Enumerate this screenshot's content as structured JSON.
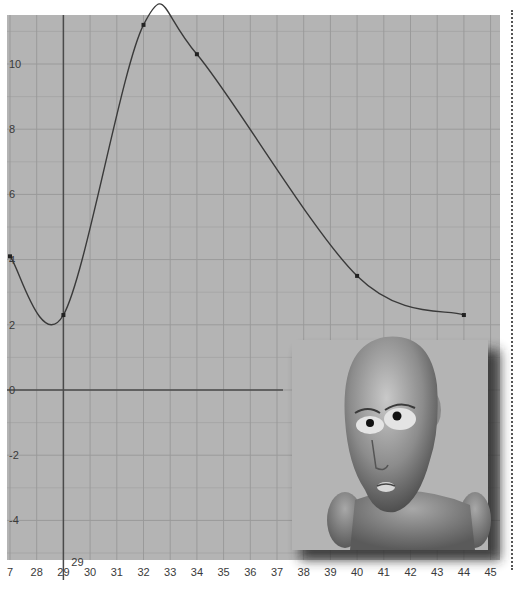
{
  "chart_data": {
    "type": "line",
    "title": "",
    "xlabel": "",
    "ylabel": "",
    "x_ticks": [
      27,
      28,
      29,
      30,
      31,
      32,
      33,
      34,
      35,
      36,
      37,
      38,
      39,
      40,
      41,
      42,
      43,
      44,
      45
    ],
    "x_tick_labels": [
      "7",
      "28",
      "29",
      "30",
      "31",
      "32",
      "33",
      "34",
      "35",
      "36",
      "37",
      "38",
      "39",
      "40",
      "41",
      "42",
      "43",
      "44",
      "45"
    ],
    "current_frame_label": "29",
    "y_ticks": [
      10,
      8,
      6,
      4,
      2,
      0,
      -2,
      -4
    ],
    "y_tick_labels": [
      "10",
      "8",
      "6",
      "4",
      "2",
      "0",
      "-2",
      "-4"
    ],
    "xlim": [
      26.9,
      45.5
    ],
    "ylim": [
      -5.2,
      11.6
    ],
    "grid": true,
    "series": [
      {
        "name": "animation curve",
        "keyframes": [
          {
            "x": 27,
            "y": 4.1
          },
          {
            "x": 29,
            "y": 2.3
          },
          {
            "x": 32,
            "y": 11.2
          },
          {
            "x": 34,
            "y": 10.3
          },
          {
            "x": 40,
            "y": 3.5
          },
          {
            "x": 44,
            "y": 2.3
          }
        ]
      }
    ]
  },
  "colors": {
    "background": "#b4b4b4",
    "grid": "#9a9a9a",
    "axis": "#4a4a4a",
    "curve": "#3a3a3a"
  },
  "overlay": {
    "figure": "bald-character-head"
  }
}
